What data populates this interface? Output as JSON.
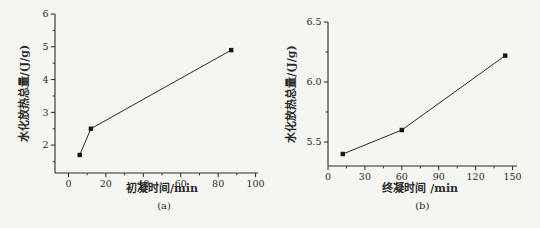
{
  "figure": {
    "background": "#f5f5f1",
    "ink": "#2b2b2b",
    "marker_color": "#161616",
    "xlabel_center_y": 192,
    "caption_center_y": 206
  },
  "chart_data": [
    {
      "id": "a",
      "type": "line",
      "title": "",
      "caption": "(a)",
      "xlabel": "初凝时间/min",
      "ylabel": "水化放热总量/(J/g)",
      "legend": "none",
      "grid": false,
      "series": [
        {
          "name": "hydration-heat-vs-initial-setting-time",
          "x": [
            6,
            12,
            87
          ],
          "y": [
            1.7,
            2.5,
            4.9
          ]
        }
      ],
      "xlim": [
        -7.2,
        101.3
      ],
      "ylim": [
        1.15,
        6.0
      ],
      "xticks": {
        "major": [
          0,
          20,
          40,
          60,
          80,
          100
        ],
        "labels": [
          "0",
          "20",
          "40",
          "60",
          "80",
          "100"
        ],
        "minor": [
          10,
          30,
          50,
          70,
          90
        ]
      },
      "yticks": {
        "major": [
          2,
          3,
          4,
          5,
          6
        ],
        "labels": [
          "2",
          "3",
          "4",
          "5",
          "6"
        ],
        "minor": [
          1.5,
          2.5,
          3.5,
          4.5,
          5.5
        ]
      },
      "plot_rect": {
        "left": 55,
        "top": 14,
        "right": 258,
        "bottom": 173
      },
      "ylabel_dx": -27
    },
    {
      "id": "b",
      "type": "line",
      "title": "",
      "caption": "(b)",
      "xlabel": "终凝时间 /min",
      "ylabel": "水化放热总量/(J/g)",
      "legend": "none",
      "grid": false,
      "series": [
        {
          "name": "hydration-heat-vs-final-setting-time",
          "x": [
            12,
            60,
            144
          ],
          "y": [
            5.4,
            5.6,
            6.22
          ]
        }
      ],
      "xlim": [
        0,
        153.6
      ],
      "ylim": [
        5.3,
        6.5
      ],
      "xticks": {
        "major": [
          0,
          30,
          60,
          90,
          120,
          150
        ],
        "labels": [
          "0",
          "30",
          "60",
          "90",
          "120",
          "150"
        ],
        "minor": [
          15,
          45,
          75,
          105,
          135
        ]
      },
      "yticks": {
        "major": [
          5.5,
          6.0,
          6.5
        ],
        "labels": [
          "5.5",
          "6.0",
          "6.5"
        ],
        "minor": [
          5.75,
          6.25
        ]
      },
      "plot_rect": {
        "left": 328,
        "top": 22,
        "right": 517,
        "bottom": 166
      },
      "ylabel_dx": -33
    }
  ]
}
